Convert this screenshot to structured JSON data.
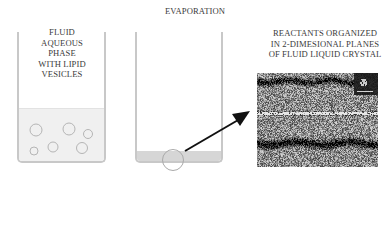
{
  "figure": {
    "evaporation_label": "EVAPORATION",
    "left_panel": {
      "label": "FLUID\nAQUEOUS\nPHASE\nWITH LIPID\nVESICLES",
      "vesicle_count": 6
    },
    "right_panel": {
      "label": "REACTANTS ORGANIZED\nIN 2-DIMESIONAL PLANES\nOF FLUID LIQUID CRYSTAL"
    },
    "micrograph": {
      "description": "lamellar lipid bilayer micrograph with molecular structure inset and scale bar"
    },
    "colors": {
      "text": "#3a3a3a",
      "beaker_wall": "#c8c8c8",
      "fluid": "#f0f0f0",
      "residue": "#d6d6d6",
      "arrow": "#111111"
    }
  }
}
